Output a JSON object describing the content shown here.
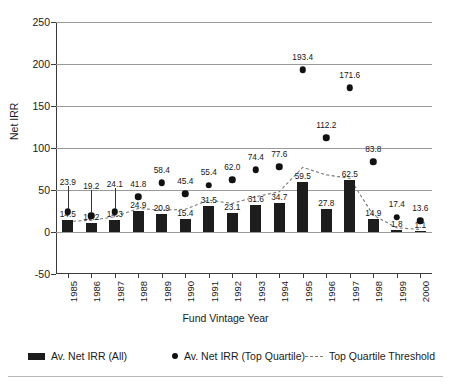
{
  "chart_data": {
    "type": "bar",
    "title": "",
    "xlabel": "Fund Vintage Year",
    "ylabel": "Net IRR",
    "ylim": [
      -50,
      250
    ],
    "ytick_labels": [
      "250",
      "200",
      "150",
      "100",
      "50",
      "0",
      "-50"
    ],
    "yticks": [
      250,
      200,
      150,
      100,
      50,
      0,
      -50
    ],
    "grid": true,
    "legend_position": "bottom",
    "categories": [
      "1985",
      "1986",
      "1987",
      "1988",
      "1989",
      "1990",
      "1991",
      "1992",
      "1993",
      "1994",
      "1995",
      "1996",
      "1997",
      "1998",
      "1999",
      "2000"
    ],
    "series": [
      {
        "name": "Av. Net IRR (All)",
        "type": "bar",
        "color": "#1d1d1d",
        "values": [
          14.5,
          10.2,
          14.3,
          24.9,
          20.9,
          15.4,
          31.5,
          23.1,
          31.6,
          34.7,
          59.5,
          27.8,
          62.5,
          14.9,
          1.8,
          1.1
        ],
        "labels": [
          "14.5",
          "10.2",
          "14.3",
          "24.9",
          "20.9",
          "15.4",
          "31.5",
          "23.1",
          "31.6",
          "34.7",
          "59.5",
          "27.8",
          "62.5",
          "14.9",
          "1.8",
          "1.1"
        ]
      },
      {
        "name": "Av. Net IRR (Top Quartile)",
        "type": "scatter",
        "color": "#111111",
        "values": [
          23.9,
          19.2,
          24.1,
          41.8,
          58.4,
          45.4,
          55.4,
          62.0,
          74.4,
          77.6,
          193.4,
          112.2,
          171.6,
          83.8,
          17.4,
          13.6
        ],
        "labels": [
          "23.9",
          "19.2",
          "24.1",
          "41.8",
          "58.4",
          "45.4",
          "55.4",
          "62.0",
          "74.4",
          "77.6",
          "193.4",
          "112.2",
          "171.6",
          "83.8",
          "17.4",
          "13.6"
        ]
      },
      {
        "name": "Top Quartile Threshold",
        "type": "line",
        "style": "dashed",
        "color": "#777777",
        "values": [
          12.5,
          14.0,
          18.0,
          28.0,
          26.0,
          27.0,
          38.0,
          34.0,
          42.0,
          48.0,
          77.0,
          68.0,
          64.0,
          20.0,
          5.0,
          3.0
        ]
      }
    ]
  },
  "legend": {
    "items": [
      {
        "label": "Av. Net IRR (All)",
        "marker": "bar-marker"
      },
      {
        "label": "Av. Net IRR (Top Quartile)",
        "marker": "dot-marker"
      },
      {
        "label": "Top Quartile Threshold",
        "marker": "dashed-line-marker"
      }
    ]
  }
}
